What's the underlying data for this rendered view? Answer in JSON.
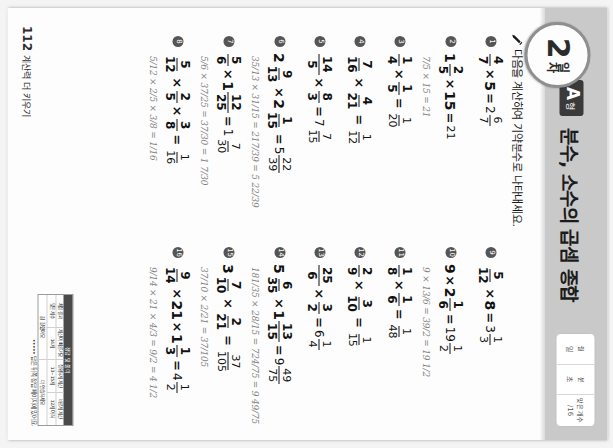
{
  "page": {
    "day_number": "2",
    "day_word": "일차",
    "type_letter": "A",
    "type_suffix": "형",
    "title": "분수, 소수의 곱셈 종합",
    "instruction": "다음을 계산하여 기약분수로 나타내세요.",
    "pencil_icon": "pencil-icon",
    "page_number": "112",
    "footer_label": "계산력 더 키우기"
  },
  "score_box": {
    "cells": [
      {
        "label": "월",
        "value": "일"
      },
      {
        "label": "분",
        "value": "초"
      },
      {
        "label": "맞은 개수",
        "value": "/16"
      }
    ]
  },
  "problems_left": [
    {
      "num": "1",
      "parts": [
        {
          "t": "frac",
          "n": "4",
          "d": "7"
        },
        {
          "t": "op",
          "v": "×"
        },
        {
          "t": "int",
          "v": "5"
        },
        {
          "t": "eq",
          "v": "="
        },
        {
          "t": "ansmixed",
          "w": "2",
          "n": "6",
          "d": "7"
        }
      ],
      "work": ""
    },
    {
      "num": "2",
      "parts": [
        {
          "t": "mixed",
          "w": "1",
          "n": "2",
          "d": "5"
        },
        {
          "t": "op",
          "v": "×"
        },
        {
          "t": "int",
          "v": "15"
        },
        {
          "t": "eq",
          "v": "="
        },
        {
          "t": "ansint",
          "v": "21"
        }
      ],
      "work": "7/5 × 15 = 21"
    },
    {
      "num": "3",
      "parts": [
        {
          "t": "frac",
          "n": "1",
          "d": "4"
        },
        {
          "t": "op",
          "v": "×"
        },
        {
          "t": "frac",
          "n": "1",
          "d": "5"
        },
        {
          "t": "eq",
          "v": "="
        },
        {
          "t": "ansfrac",
          "n": "1",
          "d": "20"
        }
      ],
      "work": ""
    },
    {
      "num": "4",
      "parts": [
        {
          "t": "frac",
          "n": "7",
          "d": "16"
        },
        {
          "t": "op",
          "v": "×"
        },
        {
          "t": "frac",
          "n": "4",
          "d": "21"
        },
        {
          "t": "eq",
          "v": "="
        },
        {
          "t": "ansfrac",
          "n": "1",
          "d": "12"
        }
      ],
      "work": ""
    },
    {
      "num": "5",
      "parts": [
        {
          "t": "frac",
          "n": "14",
          "d": "5"
        },
        {
          "t": "op",
          "v": "×"
        },
        {
          "t": "frac",
          "n": "8",
          "d": "3"
        },
        {
          "t": "eq",
          "v": "="
        },
        {
          "t": "ansmixed",
          "w": "7",
          "n": "7",
          "d": "15"
        }
      ],
      "work": ""
    },
    {
      "num": "6",
      "parts": [
        {
          "t": "mixed",
          "w": "2",
          "n": "9",
          "d": "13"
        },
        {
          "t": "op",
          "v": "×"
        },
        {
          "t": "mixed",
          "w": "2",
          "n": "1",
          "d": "15"
        },
        {
          "t": "eq",
          "v": "="
        },
        {
          "t": "ansmixed",
          "w": "5",
          "n": "22",
          "d": "39"
        }
      ],
      "work": "35/13 × 31/15 = 217/39 = 5 22/39"
    },
    {
      "num": "7",
      "parts": [
        {
          "t": "frac",
          "n": "5",
          "d": "6"
        },
        {
          "t": "op",
          "v": "×"
        },
        {
          "t": "mixed",
          "w": "1",
          "n": "12",
          "d": "25"
        },
        {
          "t": "eq",
          "v": "="
        },
        {
          "t": "ansmixed",
          "w": "1",
          "n": "7",
          "d": "30"
        }
      ],
      "work": "5/6 × 37/25 = 37/30 = 1 7/30"
    },
    {
      "num": "8",
      "parts": [
        {
          "t": "frac",
          "n": "5",
          "d": "12"
        },
        {
          "t": "op",
          "v": "×"
        },
        {
          "t": "frac",
          "n": "2",
          "d": "5"
        },
        {
          "t": "op",
          "v": "×"
        },
        {
          "t": "frac",
          "n": "3",
          "d": "8"
        },
        {
          "t": "eq",
          "v": "="
        },
        {
          "t": "ansfrac",
          "n": "1",
          "d": "16"
        }
      ],
      "work": "5/12 × 2/5 × 3/8 = 1/16"
    }
  ],
  "problems_right": [
    {
      "num": "9",
      "parts": [
        {
          "t": "frac",
          "n": "5",
          "d": "12"
        },
        {
          "t": "op",
          "v": "×"
        },
        {
          "t": "int",
          "v": "8"
        },
        {
          "t": "eq",
          "v": "="
        },
        {
          "t": "ansmixed",
          "w": "3",
          "n": "1",
          "d": "3"
        }
      ],
      "work": ""
    },
    {
      "num": "10",
      "parts": [
        {
          "t": "int",
          "v": "9"
        },
        {
          "t": "op",
          "v": "×"
        },
        {
          "t": "mixed",
          "w": "2",
          "n": "1",
          "d": "6"
        },
        {
          "t": "eq",
          "v": "="
        },
        {
          "t": "ansmixed",
          "w": "19",
          "n": "1",
          "d": "2"
        }
      ],
      "work": "9 × 13/6 = 39/2 = 19 1/2"
    },
    {
      "num": "11",
      "parts": [
        {
          "t": "frac",
          "n": "1",
          "d": "8"
        },
        {
          "t": "op",
          "v": "×"
        },
        {
          "t": "frac",
          "n": "1",
          "d": "6"
        },
        {
          "t": "eq",
          "v": "="
        },
        {
          "t": "ansfrac",
          "n": "1",
          "d": "48"
        }
      ],
      "work": ""
    },
    {
      "num": "12",
      "parts": [
        {
          "t": "frac",
          "n": "2",
          "d": "9"
        },
        {
          "t": "op",
          "v": "×"
        },
        {
          "t": "frac",
          "n": "3",
          "d": "10"
        },
        {
          "t": "eq",
          "v": "="
        },
        {
          "t": "ansfrac",
          "n": "1",
          "d": "15"
        }
      ],
      "work": ""
    },
    {
      "num": "13",
      "parts": [
        {
          "t": "frac",
          "n": "25",
          "d": "6"
        },
        {
          "t": "op",
          "v": "×"
        },
        {
          "t": "frac",
          "n": "3",
          "d": "2"
        },
        {
          "t": "eq",
          "v": "="
        },
        {
          "t": "ansmixed",
          "w": "6",
          "n": "1",
          "d": "4"
        }
      ],
      "work": ""
    },
    {
      "num": "14",
      "parts": [
        {
          "t": "mixed",
          "w": "5",
          "n": "6",
          "d": "35"
        },
        {
          "t": "op",
          "v": "×"
        },
        {
          "t": "mixed",
          "w": "1",
          "n": "13",
          "d": "15"
        },
        {
          "t": "eq",
          "v": "="
        },
        {
          "t": "ansmixed",
          "w": "9",
          "n": "49",
          "d": "75"
        }
      ],
      "work": "181/35 × 28/15 = 724/75 = 9 49/75"
    },
    {
      "num": "15",
      "parts": [
        {
          "t": "mixed",
          "w": "3",
          "n": "7",
          "d": "10"
        },
        {
          "t": "op",
          "v": "×"
        },
        {
          "t": "frac",
          "n": "2",
          "d": "21"
        },
        {
          "t": "eq",
          "v": "="
        },
        {
          "t": "ansfrac",
          "n": "37",
          "d": "105"
        }
      ],
      "work": "37/10 × 2/21 = 37/105"
    },
    {
      "num": "16",
      "parts": [
        {
          "t": "frac",
          "n": "9",
          "d": "14"
        },
        {
          "t": "op",
          "v": "×"
        },
        {
          "t": "int",
          "v": "21"
        },
        {
          "t": "op",
          "v": "×"
        },
        {
          "t": "mixed",
          "w": "1",
          "n": "1",
          "d": "3"
        },
        {
          "t": "eq",
          "v": "="
        },
        {
          "t": "ansmixed",
          "w": "4",
          "n": "1",
          "d": "2"
        }
      ],
      "work": "9/14 × 21 × 4/3 = 9/2 = 4 1/2"
    }
  ],
  "stamp": {
    "title": "정답 및 풀이",
    "cells": [
      "정답 확인",
      "문제를 다시",
      "다시 푼 문제",
      "틀린 문제"
    ],
    "rows": [
      [
        "채점 결과",
        "계산이 빠른가요",
        "정확하게 계산",
        "바르게 계산"
      ],
      [
        "맞은 개수",
        "16개",
        "13~15개",
        "12개 이하"
      ]
    ],
    "foot": [
      "참 잘했어요",
      "더 연습하세요"
    ],
    "note": "••••• 답은 뒤쪽 정답 페이지에 있어요."
  }
}
